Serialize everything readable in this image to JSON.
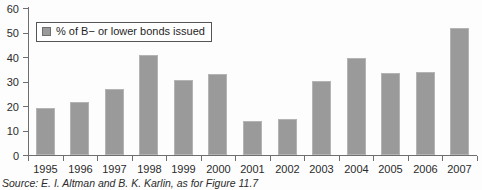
{
  "chart_data": {
    "type": "bar",
    "title": "",
    "xlabel": "",
    "ylabel": "",
    "ylim": [
      0,
      60
    ],
    "ytick_step": 10,
    "yticks": [
      60,
      50,
      40,
      30,
      20,
      10,
      0
    ],
    "grid": false,
    "legend_position": "top-left-inside",
    "categories": [
      "1995",
      "1996",
      "1997",
      "1998",
      "1999",
      "2000",
      "2001",
      "2002",
      "2003",
      "2004",
      "2005",
      "2006",
      "2007"
    ],
    "series": [
      {
        "name": "% of B− or lower bonds issued",
        "values": [
          19,
          21.5,
          27,
          41,
          30.5,
          33,
          14,
          14.5,
          30,
          39.5,
          33.5,
          34,
          52
        ]
      }
    ]
  },
  "legend": {
    "label": "% of B− or lower bonds issued",
    "swatch_color": "#9a9a9a"
  },
  "source": {
    "prefix": "Source:",
    "text": "E. I. Altman and B. K. Karlin, as for Figure 11.7"
  },
  "colors": {
    "bar": "#9a9a9a",
    "bar_border": "#b4b4b4",
    "axis": "#6e6e6e",
    "text": "#2b2b2b",
    "background": "#fdfdfd"
  }
}
